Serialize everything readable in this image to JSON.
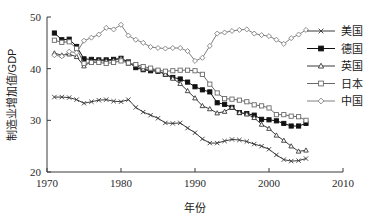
{
  "chart_data": {
    "type": "line",
    "title": "",
    "xlabel": "年份",
    "ylabel": "制造业增加值/GDP",
    "xlim": [
      1970,
      2010
    ],
    "ylim": [
      20,
      50
    ],
    "xticks": [
      1970,
      1980,
      1990,
      2000,
      2010
    ],
    "yticks": [
      20,
      30,
      40,
      50
    ],
    "grid": false,
    "legend_position": "right",
    "x": [
      1971,
      1972,
      1973,
      1974,
      1975,
      1976,
      1977,
      1978,
      1979,
      1980,
      1981,
      1982,
      1983,
      1984,
      1985,
      1986,
      1987,
      1988,
      1989,
      1990,
      1991,
      1992,
      1993,
      1994,
      1995,
      1996,
      1997,
      1998,
      1999,
      2000,
      2001,
      2002,
      2003,
      2004,
      2005
    ],
    "series": [
      {
        "name": "美国",
        "marker": "x-cross",
        "color": "#3a3a3a",
        "fill": "none",
        "values": [
          34.5,
          34.5,
          34.4,
          34.0,
          33.3,
          33.6,
          33.9,
          34.0,
          33.7,
          33.6,
          34.0,
          32.5,
          31.6,
          31.0,
          30.4,
          29.5,
          29.4,
          29.5,
          28.5,
          27.6,
          26.4,
          25.6,
          25.6,
          26.0,
          26.3,
          26.2,
          25.9,
          25.4,
          25.0,
          24.4,
          23.3,
          22.4,
          22.1,
          22.2,
          22.6
        ]
      },
      {
        "name": "德国",
        "marker": "filled-square",
        "color": "#111111",
        "fill": "#111111",
        "values": [
          46.9,
          45.6,
          45.7,
          44.3,
          41.9,
          41.8,
          41.7,
          41.7,
          41.8,
          42.0,
          41.3,
          40.2,
          39.8,
          39.6,
          39.5,
          38.9,
          38.3,
          38.0,
          37.4,
          36.5,
          35.9,
          35.5,
          33.4,
          33.1,
          32.5,
          31.5,
          31.3,
          31.0,
          30.2,
          30.1,
          29.9,
          29.4,
          28.9,
          28.9,
          29.4
        ]
      },
      {
        "name": "英国",
        "marker": "open-triangle",
        "color": "#3a3a3a",
        "fill": "#ffffff",
        "values": [
          43.0,
          42.6,
          42.8,
          42.3,
          40.5,
          41.4,
          41.6,
          41.5,
          41.6,
          42.0,
          41.0,
          40.7,
          39.9,
          39.9,
          39.6,
          38.9,
          38.1,
          37.1,
          35.7,
          34.3,
          32.8,
          32.2,
          31.4,
          31.7,
          32.5,
          31.5,
          31.2,
          30.5,
          29.2,
          28.4,
          27.1,
          26.1,
          25.0,
          24.0,
          24.2
        ]
      },
      {
        "name": "日本",
        "marker": "open-square",
        "color": "#6a6a6a",
        "fill": "#ffffff",
        "values": [
          45.5,
          45.1,
          45.2,
          43.9,
          41.0,
          41.2,
          41.2,
          41.0,
          41.2,
          41.5,
          41.1,
          40.8,
          40.4,
          40.1,
          39.7,
          39.5,
          39.6,
          39.7,
          39.7,
          39.6,
          38.9,
          37.0,
          35.3,
          34.2,
          34.1,
          33.9,
          33.6,
          33.0,
          32.8,
          32.4,
          31.1,
          31.1,
          30.8,
          30.7,
          30.0
        ]
      },
      {
        "name": "中国",
        "marker": "open-diamond",
        "color": "#808080",
        "fill": "#ffffff",
        "values": [
          42.6,
          42.4,
          43.3,
          43.1,
          45.4,
          46.0,
          46.6,
          47.9,
          47.6,
          48.5,
          46.4,
          45.6,
          45.0,
          44.2,
          44.0,
          43.9,
          44.0,
          44.0,
          43.4,
          41.5,
          42.1,
          44.4,
          46.8,
          47.0,
          47.3,
          47.5,
          47.6,
          46.8,
          46.5,
          46.3,
          45.6,
          44.8,
          45.9,
          46.6,
          47.5
        ]
      }
    ]
  },
  "legend": {
    "items": [
      {
        "label": "美国"
      },
      {
        "label": "德国"
      },
      {
        "label": "英国"
      },
      {
        "label": "日本"
      },
      {
        "label": "中国"
      }
    ]
  },
  "axis": {
    "y_title": "制造业增加值/GDP",
    "x_title": "年份",
    "x_tick_labels": [
      "1970",
      "1980",
      "1990",
      "2000",
      "2010"
    ],
    "y_tick_labels": [
      "20",
      "30",
      "40",
      "50"
    ]
  }
}
